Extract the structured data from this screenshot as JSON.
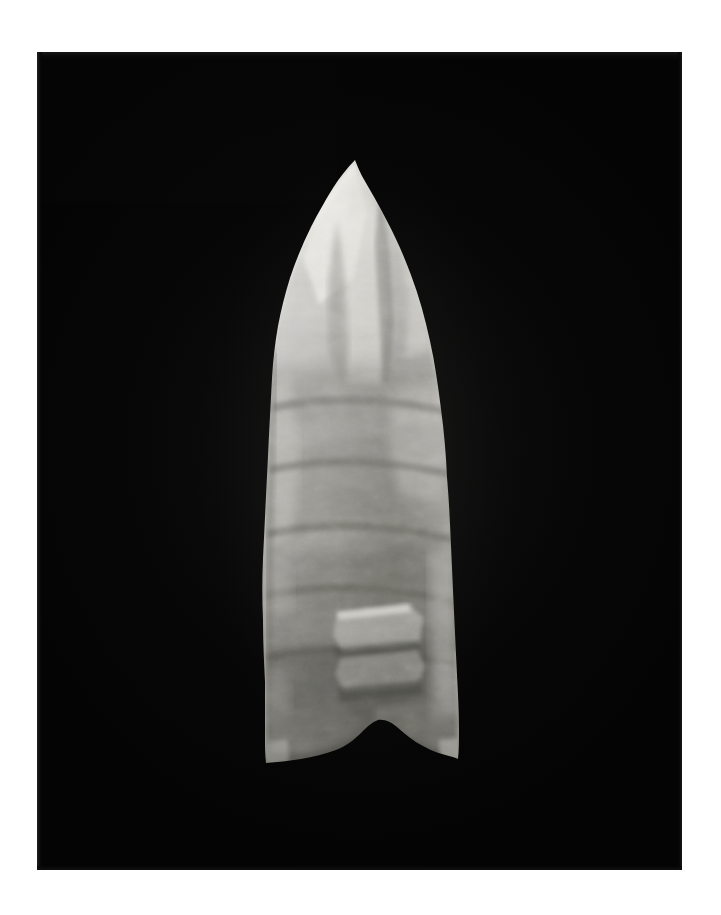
{
  "page": {
    "background_color": "#ffffff",
    "width": 721,
    "height": 915,
    "caption": ""
  },
  "photograph": {
    "name": "stone-projectile-point-photograph",
    "medium": "black-and-white photographic print",
    "background_color": "#040404",
    "frame": {
      "left": 37,
      "top": 52,
      "width": 645,
      "height": 818
    },
    "subject": {
      "label": "fluted lanceolate stone projectile point",
      "view": "single face, vertical, tip up",
      "material_appearance": "chert / flint, light to medium gray",
      "base_form": "concave notched base",
      "tip_form": "pointed apex",
      "bounds_in_frame": {
        "left": 225,
        "top": 108,
        "right": 415,
        "bottom": 713
      },
      "highlight_color": "#e9e8e4",
      "midtone_color": "#a8a7a2",
      "shadow_color": "#3a3a38",
      "deep_shadow_color": "#1c1c1b"
    }
  },
  "labels": {
    "has_text": false,
    "has_scale_bar": false,
    "has_catalog_number": false
  },
  "chart_data": null
}
